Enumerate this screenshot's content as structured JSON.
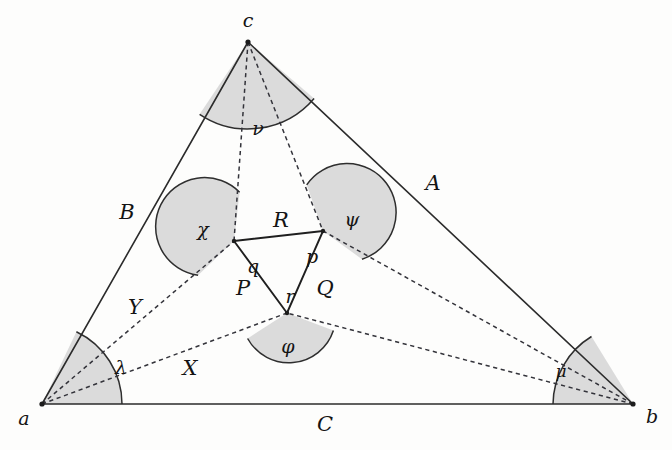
{
  "figure": {
    "kind": "geometry-diagram",
    "background_color": "#fdfdfc",
    "ink_color": "#1c1c1c",
    "sector_fill_color": "#d9d9d9",
    "sector_stroke_color": "#2e2e2e"
  },
  "outer_triangle": {
    "vertices": [
      {
        "id": "a",
        "label": "a",
        "x": 42,
        "y": 404
      },
      {
        "id": "b",
        "label": "b",
        "x": 633,
        "y": 404
      },
      {
        "id": "c",
        "label": "c",
        "x": 248,
        "y": 42
      }
    ],
    "sides": [
      {
        "id": "A",
        "label": "A",
        "from": "c",
        "to": "b",
        "label_x": 433,
        "label_y": 183
      },
      {
        "id": "B",
        "label": "B",
        "from": "a",
        "to": "c",
        "label_x": 127,
        "label_y": 212
      },
      {
        "id": "C",
        "label": "C",
        "from": "a",
        "to": "b",
        "label_x": 325,
        "label_y": 424
      }
    ]
  },
  "inner_triangle": {
    "vertices": [
      {
        "id": "q",
        "label": "q",
        "x": 234,
        "y": 241,
        "label_x": 253,
        "label_y": 266
      },
      {
        "id": "p",
        "label": "p",
        "x": 323,
        "y": 231,
        "label_x": 312,
        "label_y": 256
      },
      {
        "id": "r",
        "label": "r",
        "x": 287,
        "y": 313,
        "label_x": 290,
        "label_y": 296
      }
    ],
    "sides": [
      {
        "id": "R",
        "label": "R",
        "from": "q",
        "to": "p",
        "label_x": 281,
        "label_y": 220
      },
      {
        "id": "P",
        "label": "P",
        "from": "q",
        "to": "r",
        "label_x": 243,
        "label_y": 288
      },
      {
        "id": "Q",
        "label": "Q",
        "from": "p",
        "to": "r",
        "label_x": 325,
        "label_y": 288
      }
    ]
  },
  "cevians": [
    {
      "id": "a-q",
      "label": "Y",
      "from": "a",
      "to": "q",
      "label_x": 135,
      "label_y": 307
    },
    {
      "id": "a-r",
      "label": "X",
      "from": "a",
      "to": "r",
      "label_x": 190,
      "label_y": 368
    },
    {
      "id": "b-p",
      "label": "",
      "from": "b",
      "to": "p"
    },
    {
      "id": "b-r",
      "label": "",
      "from": "b",
      "to": "r"
    },
    {
      "id": "c-q",
      "label": "",
      "from": "c",
      "to": "q"
    },
    {
      "id": "c-p",
      "label": "",
      "from": "c",
      "to": "p"
    }
  ],
  "angle_marks": [
    {
      "id": "nu",
      "label": "ν",
      "at": "c",
      "label_x": 258,
      "label_y": 128
    },
    {
      "id": "chi",
      "label": "χ",
      "at": "q",
      "label_x": 203,
      "label_y": 229
    },
    {
      "id": "psi",
      "label": "ψ",
      "at": "p",
      "label_x": 352,
      "label_y": 219
    },
    {
      "id": "phi",
      "label": "φ",
      "at": "r",
      "label_x": 288,
      "label_y": 346
    },
    {
      "id": "lambda",
      "label": "λ",
      "at": "a",
      "label_x": 121,
      "label_y": 367
    },
    {
      "id": "mu",
      "label": "μ",
      "at": "b",
      "label_x": 561,
      "label_y": 371
    }
  ],
  "caption": {
    "text": "",
    "visible": false
  }
}
